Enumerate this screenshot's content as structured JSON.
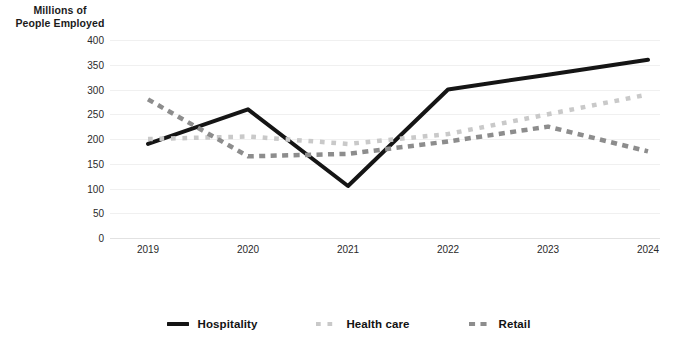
{
  "chart_data": {
    "type": "line",
    "title": "",
    "subtitle": "",
    "xlabel": "",
    "ylabel": "Millions of\nPeople Employed",
    "ylabel_line1": "Millions of",
    "ylabel_line2": "People Employed",
    "categories": [
      "2019",
      "2020",
      "2021",
      "2022",
      "2023",
      "2024"
    ],
    "x": [
      2019,
      2020,
      2021,
      2022,
      2023,
      2024
    ],
    "ylim": [
      0,
      400
    ],
    "y_ticks": [
      0,
      50,
      100,
      150,
      200,
      250,
      300,
      350,
      400
    ],
    "y_tick_labels": [
      "0",
      "50",
      "100",
      "150",
      "200",
      "250",
      "300",
      "350",
      "400"
    ],
    "grid": true,
    "grid_axis": "y",
    "legend_position": "bottom",
    "series": [
      {
        "name": "Hospitality",
        "values": [
          190,
          260,
          105,
          300,
          330,
          360
        ],
        "color": "#151515",
        "style": "solid",
        "width": 4
      },
      {
        "name": "Health care",
        "values": [
          200,
          205,
          190,
          210,
          250,
          290
        ],
        "color": "#c9c9c9",
        "style": "dotted",
        "width": 4.5
      },
      {
        "name": "Retail",
        "values": [
          280,
          165,
          170,
          195,
          225,
          175
        ],
        "color": "#8d8d8d",
        "style": "dashed",
        "width": 4.5
      }
    ]
  },
  "legend": {
    "items": [
      {
        "label": "Hospitality",
        "swatch": "solid-line-swatch"
      },
      {
        "label": "Health care",
        "swatch": "dotted-line-swatch"
      },
      {
        "label": "Retail",
        "swatch": "dashed-line-swatch"
      }
    ]
  }
}
